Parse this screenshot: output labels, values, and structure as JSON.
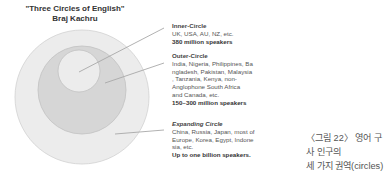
{
  "title": {
    "line1": "\"Three Circles of English\"",
    "line2": "Braj Kachru"
  },
  "colors": {
    "outer_ring": "#ececec",
    "middle_ring": "#d6d6d6",
    "inner_circle": "#ececec",
    "stroke": "#c4c4c4",
    "leader_line": "#a8a8a8"
  },
  "circles": [
    {
      "name": "Inner-Circle",
      "countries_lines": [
        "UK, USA, AU, NZ, etc."
      ],
      "speakers": "380 million speakers"
    },
    {
      "name": "Outer-Circle",
      "countries_lines": [
        "India, Nigeria, Philippines, Ba",
        "ngladesh, Pakistan, Malaysia",
        ", Tanzania, Kenya, non-",
        "Anglophone South Africa",
        "and Canada, etc."
      ],
      "speakers": "150~300 million speakers"
    },
    {
      "name": "Expanding Circle",
      "countries_lines": [
        "China, Russia, Japan, most of",
        "Europe, Korea, Egypt, Indone",
        "sia, etc."
      ],
      "speakers": "Up to one billion speakers."
    }
  ],
  "caption": {
    "line1": "〈그림 22〉 영어 구사 인구의",
    "line2": "세 가지 권역(circles)"
  }
}
